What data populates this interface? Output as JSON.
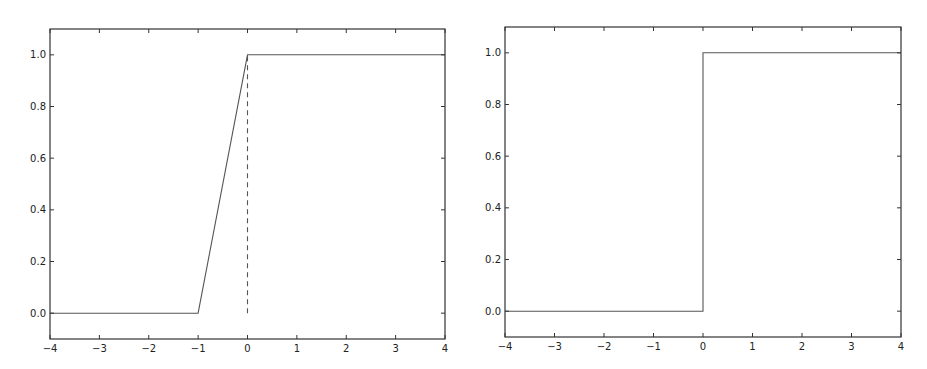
{
  "chart_data": [
    {
      "type": "line",
      "title": "",
      "xlabel": "",
      "ylabel": "",
      "xlim": [
        -4,
        4
      ],
      "ylim": [
        -0.1,
        1.1
      ],
      "grid": false,
      "xticks": [
        "−4",
        "−3",
        "−2",
        "−1",
        "0",
        "1",
        "2",
        "3",
        "4"
      ],
      "yticks": [
        "0.0",
        "0.2",
        "0.4",
        "0.6",
        "0.8",
        "1.0"
      ],
      "series": [
        {
          "name": "ramp",
          "style": "solid",
          "x": [
            -4,
            -1,
            0,
            4
          ],
          "y": [
            0,
            0,
            1,
            1
          ]
        },
        {
          "name": "vertical-marker",
          "style": "dashed",
          "x": [
            0,
            0
          ],
          "y": [
            0,
            1
          ]
        }
      ]
    },
    {
      "type": "line",
      "title": "",
      "xlabel": "",
      "ylabel": "",
      "xlim": [
        -4,
        4
      ],
      "ylim": [
        -0.1,
        1.1
      ],
      "grid": false,
      "xticks": [
        "−4",
        "−3",
        "−2",
        "−1",
        "0",
        "1",
        "2",
        "3",
        "4"
      ],
      "yticks": [
        "0.0",
        "0.2",
        "0.4",
        "0.6",
        "0.8",
        "1.0"
      ],
      "series": [
        {
          "name": "step",
          "style": "solid",
          "x": [
            -4,
            0,
            0,
            4
          ],
          "y": [
            0,
            0,
            1,
            1
          ]
        }
      ]
    }
  ],
  "colors": {
    "line": "#555555",
    "axes": "#333333"
  }
}
